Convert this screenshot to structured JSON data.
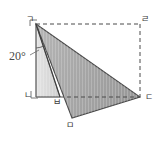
{
  "figure": {
    "type": "geometry-diagram",
    "width": 164,
    "height": 143,
    "background_color": "#ffffff",
    "angle_label": "20°",
    "vertices": [
      {
        "name": "vertex-g",
        "label": "ㄱ",
        "x": 36,
        "y": 24
      },
      {
        "name": "vertex-r",
        "label": "ㄹ",
        "x": 140,
        "y": 24
      },
      {
        "name": "vertex-n",
        "label": "ㄴ",
        "x": 36,
        "y": 97
      },
      {
        "name": "vertex-d",
        "label": "ㄷ",
        "x": 140,
        "y": 97
      },
      {
        "name": "vertex-b",
        "label": "ㅂ",
        "x": 60,
        "y": 97
      },
      {
        "name": "vertex-m",
        "label": "ㅁ",
        "x": 72,
        "y": 118
      }
    ],
    "shapes": {
      "light_triangle": {
        "name": "light-shaded-triangle",
        "points": "36,24 36,97 60,97",
        "fill": "#d9d9d9",
        "stroke": "#6b6b6b"
      },
      "dark_triangle": {
        "name": "dark-shaded-triangle",
        "points": "36,24 140,97 72,118",
        "fill": "#a8a8a8",
        "stroke": "#4a4a4a"
      },
      "rectangle": {
        "name": "dashed-rectangle",
        "points": "36,24 140,24 140,97 36,97",
        "stroke": "#4a4a4a",
        "dash": "4,3"
      }
    },
    "colors": {
      "light_fill": "#d9d9d9",
      "dark_fill": "#a8a8a8",
      "line": "#4a4a4a",
      "text": "#4a4a4a"
    }
  }
}
